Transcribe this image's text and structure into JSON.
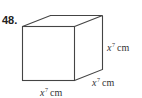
{
  "problem": {
    "number": "48."
  },
  "figure": {
    "shape": "cube",
    "stroke_color": "#444444",
    "labels": {
      "height": {
        "variable": "x",
        "exponent": "7",
        "unit": "cm"
      },
      "depth": {
        "variable": "x",
        "exponent": "7",
        "unit": "cm"
      },
      "width": {
        "variable": "x",
        "exponent": "7",
        "unit": "cm"
      }
    }
  }
}
